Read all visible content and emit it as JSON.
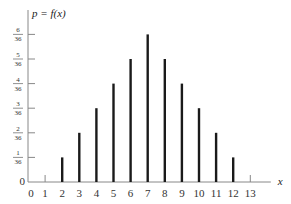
{
  "chart_data": {
    "type": "bar",
    "title": "p = f(x)",
    "xlabel": "x",
    "ylabel": "p = f(x)",
    "x_ticks": [
      "0",
      "1",
      "2",
      "3",
      "4",
      "5",
      "6",
      "7",
      "8",
      "9",
      "10",
      "11",
      "12",
      "13"
    ],
    "y_ticks": [
      {
        "num": "1",
        "den": "36",
        "value": 1
      },
      {
        "num": "2",
        "den": "36",
        "value": 2
      },
      {
        "num": "3",
        "den": "36",
        "value": 3
      },
      {
        "num": "4",
        "den": "36",
        "value": 4
      },
      {
        "num": "5",
        "den": "36",
        "value": 5
      },
      {
        "num": "6",
        "den": "36",
        "value": 6
      }
    ],
    "y_origin_label": "0",
    "categories": [
      2,
      3,
      4,
      5,
      6,
      7,
      8,
      9,
      10,
      11,
      12
    ],
    "values": [
      0.0278,
      0.0556,
      0.0833,
      0.1111,
      0.1389,
      0.1667,
      0.1389,
      0.1111,
      0.0833,
      0.0556,
      0.0278
    ],
    "values_in_36ths": [
      1,
      2,
      3,
      4,
      5,
      6,
      5,
      4,
      3,
      2,
      1
    ],
    "xlim": [
      0,
      13.5
    ],
    "ylim": [
      0,
      0.1667
    ],
    "grid": false,
    "legend": "none",
    "bar_color": "#1a1a1a",
    "axis_color": "#888888"
  }
}
